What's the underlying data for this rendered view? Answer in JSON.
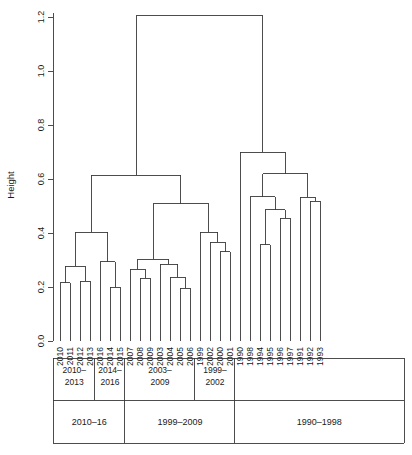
{
  "figure": {
    "type": "dendrogram",
    "y_axis_title": "Height",
    "y_ticks": [
      "0.0",
      "0.2",
      "0.4",
      "0.6",
      "0.8",
      "1.0",
      "1.2"
    ],
    "y_tick_values": [
      0.0,
      0.2,
      0.4,
      0.6,
      0.8,
      1.0,
      1.2
    ],
    "ylim": [
      0.0,
      1.2
    ],
    "line_color": "#3a3a3a",
    "background": "#ffffff"
  },
  "chart_data": {
    "type": "dendrogram",
    "title": "",
    "xlabel": "",
    "ylabel": "Height",
    "ylim": [
      0.0,
      1.2
    ],
    "grid": false,
    "legend": "none",
    "leaves": [
      "2010",
      "2011",
      "2012",
      "2013",
      "2016",
      "2014",
      "2015",
      "2007",
      "2008",
      "2009",
      "2003",
      "2004",
      "2005",
      "2006",
      "1999",
      "2002",
      "2000",
      "2001",
      "1990",
      "1998",
      "1994",
      "1995",
      "1996",
      "1997",
      "1991",
      "1992",
      "1993"
    ],
    "merges": [
      {
        "id": "m1",
        "left": "2010",
        "right": "2011",
        "height": 0.215
      },
      {
        "id": "m2",
        "left": "2012",
        "right": "2013",
        "height": 0.222
      },
      {
        "id": "m3",
        "left": "m1",
        "right": "m2",
        "height": 0.277
      },
      {
        "id": "m4",
        "left": "2014",
        "right": "2015",
        "height": 0.2
      },
      {
        "id": "m5",
        "left": "2016",
        "right": "m4",
        "height": 0.293
      },
      {
        "id": "m6",
        "left": "m3",
        "right": "m5",
        "height": 0.402
      },
      {
        "id": "m7",
        "left": "2008",
        "right": "2009",
        "height": 0.233
      },
      {
        "id": "m8",
        "left": "2007",
        "right": "m7",
        "height": 0.265
      },
      {
        "id": "m9",
        "left": "2005",
        "right": "2006",
        "height": 0.196
      },
      {
        "id": "m10",
        "left": "2004",
        "right": "m9",
        "height": 0.236
      },
      {
        "id": "m11",
        "left": "2003",
        "right": "m10",
        "height": 0.285
      },
      {
        "id": "m12",
        "left": "m8",
        "right": "m11",
        "height": 0.303
      },
      {
        "id": "m13",
        "left": "2000",
        "right": "2001",
        "height": 0.33
      },
      {
        "id": "m14",
        "left": "2002",
        "right": "m13",
        "height": 0.365
      },
      {
        "id": "m15",
        "left": "1999",
        "right": "m14",
        "height": 0.402
      },
      {
        "id": "m16",
        "left": "m12",
        "right": "m15",
        "height": 0.508
      },
      {
        "id": "m17",
        "left": "m6",
        "right": "m16",
        "height": 0.613
      },
      {
        "id": "m18",
        "left": "1994",
        "right": "1995",
        "height": 0.357
      },
      {
        "id": "m19",
        "left": "1996",
        "right": "1997",
        "height": 0.455
      },
      {
        "id": "m20",
        "left": "m18",
        "right": "m19",
        "height": 0.487
      },
      {
        "id": "m21",
        "left": "1998",
        "right": "m20",
        "height": 0.535
      },
      {
        "id": "m22",
        "left": "1992",
        "right": "1993",
        "height": 0.518
      },
      {
        "id": "m23",
        "left": "1991",
        "right": "m22",
        "height": 0.533
      },
      {
        "id": "m24",
        "left": "m21",
        "right": "m23",
        "height": 0.62
      },
      {
        "id": "m25",
        "left": "1990",
        "right": "m24",
        "height": 0.7
      },
      {
        "id": "m26",
        "left": "m17",
        "right": "m25",
        "height": 1.205
      }
    ]
  },
  "brackets": {
    "row1": [
      {
        "label_line1": "2010–",
        "label_line2": "2013",
        "start_leaf": 0,
        "end_leaf": 3
      },
      {
        "label_line1": "2014–",
        "label_line2": "2016",
        "start_leaf": 4,
        "end_leaf": 6
      },
      {
        "label_line1": "2003–",
        "label_line2": "2009",
        "start_leaf": 7,
        "end_leaf": 13
      },
      {
        "label_line1": "1999–",
        "label_line2": "2002",
        "start_leaf": 14,
        "end_leaf": 17
      },
      {
        "label_line1": "",
        "label_line2": "",
        "start_leaf": 18,
        "end_leaf": 26
      }
    ],
    "row2": [
      {
        "label": "2010–16",
        "start_leaf": 0,
        "end_leaf": 6
      },
      {
        "label": "1999–2009",
        "start_leaf": 7,
        "end_leaf": 17
      },
      {
        "label": "1990–1998",
        "start_leaf": 18,
        "end_leaf": 26
      }
    ]
  }
}
